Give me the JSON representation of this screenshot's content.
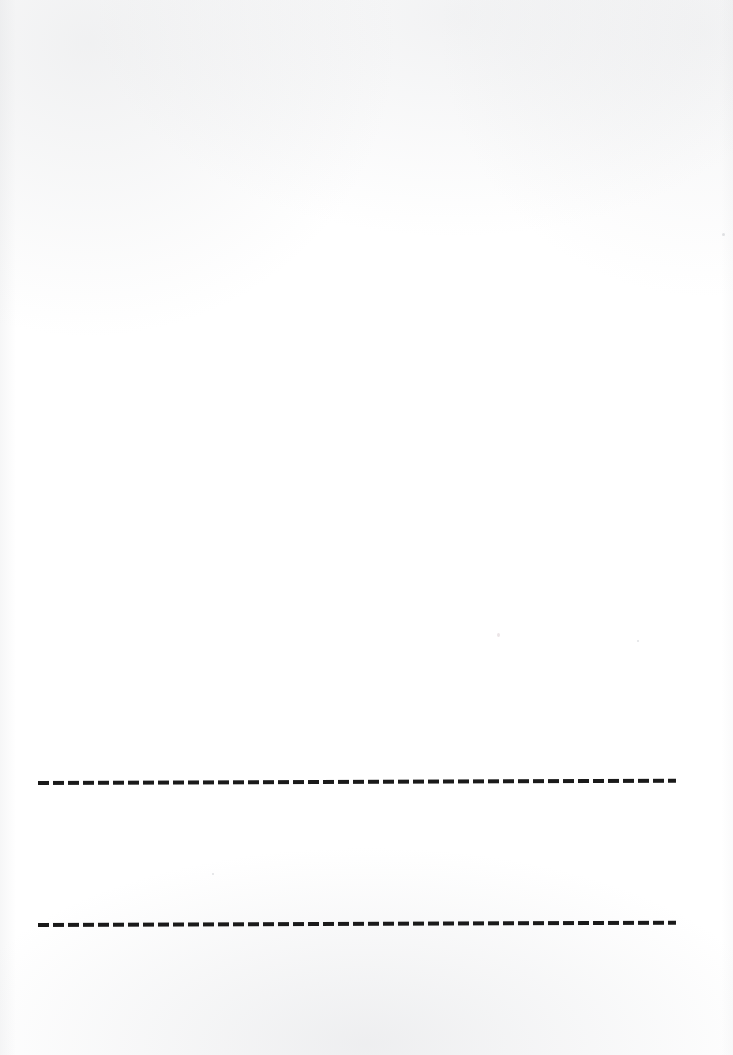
{
  "document": {
    "kind": "scanned-blank-page",
    "page_background_color": "#ffffff",
    "width_px": 733,
    "height_px": 1055,
    "body_text": "",
    "heading_text": ""
  },
  "rules": [
    {
      "id": "rule-1",
      "label": "upper-dashed-rule",
      "style": "dashed",
      "ink_color": "#1a1a1a",
      "x_start_px": 38,
      "x_end_px": 676,
      "y_center_px": 783,
      "length_px": 638,
      "thickness_px": 4,
      "dash_length_px": 11,
      "dash_gap_px": 4,
      "dash_count": 42,
      "tilt_deg": -0.2
    },
    {
      "id": "rule-2",
      "label": "lower-dashed-rule",
      "style": "dashed",
      "ink_color": "#1a1a1a",
      "x_start_px": 38,
      "x_end_px": 676,
      "y_center_px": 925,
      "length_px": 638,
      "thickness_px": 4,
      "dash_length_px": 11,
      "dash_gap_px": 4,
      "dash_count": 42,
      "tilt_deg": -0.2
    }
  ],
  "gap_between_rules_px": 142
}
